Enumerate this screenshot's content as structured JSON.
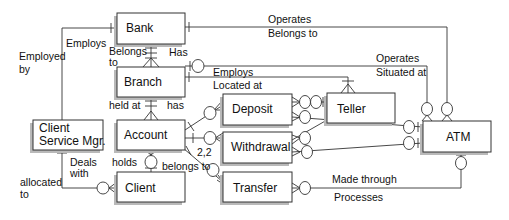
{
  "diagram": {
    "type": "entity-relationship",
    "entities": [
      {
        "id": "bank",
        "label": "Bank"
      },
      {
        "id": "branch",
        "label": "Branch"
      },
      {
        "id": "csm",
        "label_line1": "Client",
        "label_line2": "Service Mgr."
      },
      {
        "id": "account",
        "label": "Account"
      },
      {
        "id": "client",
        "label": "Client"
      },
      {
        "id": "deposit",
        "label": "Deposit"
      },
      {
        "id": "withdrawal",
        "label": "Withdrawal"
      },
      {
        "id": "transfer",
        "label": "Transfer"
      },
      {
        "id": "teller",
        "label": "Teller"
      },
      {
        "id": "atm",
        "label": "ATM"
      }
    ],
    "relationship_labels": {
      "employs": "Employs",
      "employed_by_1": "Employed",
      "employed_by_2": "by",
      "belongs_to_1": "Belongs",
      "belongs_to_2": "to",
      "has": "Has",
      "operates_top": "Operates",
      "belongs_to_top": "Belongs to",
      "operates_mid": "Operates",
      "situated_at": "Situated at",
      "employs_teller": "Employs",
      "located_at": "Located at",
      "held_at": "held at",
      "has_lower": "has",
      "deals_1": "Deals",
      "deals_2": "with",
      "allocated_1": "allocated",
      "allocated_2": "to",
      "holds": "holds",
      "belongs_to_account": "belongs to",
      "cardinality": "2,2",
      "made_through": "Made through",
      "processes": "Processes"
    }
  }
}
